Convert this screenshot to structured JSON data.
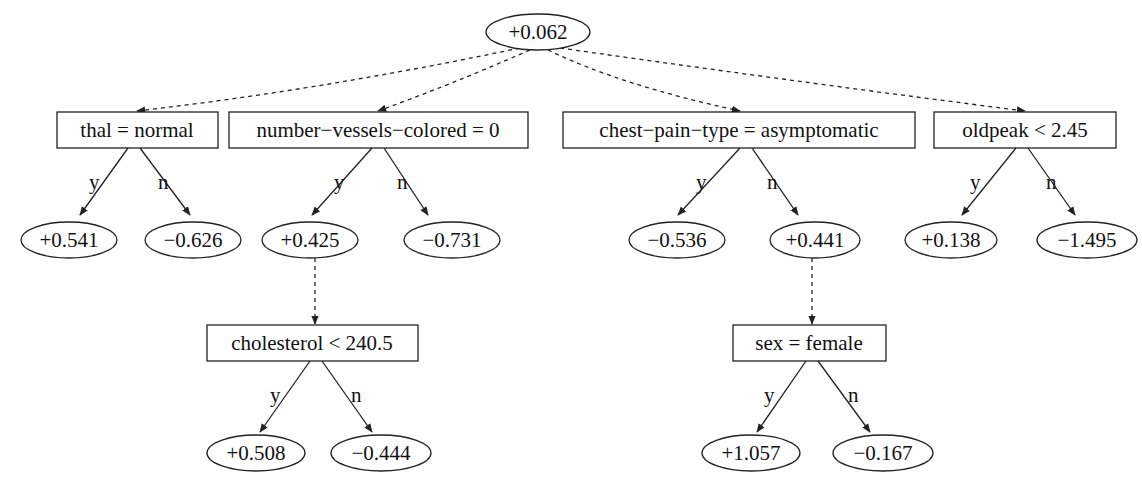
{
  "diagram": {
    "type": "alternating-decision-tree",
    "root": {
      "label": "+0.062"
    },
    "splitters": [
      {
        "id": "s1",
        "label": "thal = normal",
        "yes": "+0.541",
        "no": "−0.626"
      },
      {
        "id": "s2",
        "label": "number−vessels−colored = 0",
        "yes": "+0.425",
        "no": "−0.731"
      },
      {
        "id": "s3",
        "label": "chest−pain−type = asymptomatic",
        "yes": "−0.536",
        "no": "+0.441"
      },
      {
        "id": "s4",
        "label": "oldpeak < 2.45",
        "yes": "+0.138",
        "no": "−1.495"
      },
      {
        "id": "s5",
        "label": "cholesterol < 240.5",
        "parent_prediction": "+0.425",
        "yes": "+0.508",
        "no": "−0.444"
      },
      {
        "id": "s6",
        "label": "sex = female",
        "parent_prediction": "+0.441",
        "yes": "+1.057",
        "no": "−0.167"
      }
    ],
    "edge_labels": {
      "yes": "y",
      "no": "n"
    },
    "colors": {
      "stroke": "#222222",
      "text": "#111111",
      "background": "#ffffff"
    }
  }
}
